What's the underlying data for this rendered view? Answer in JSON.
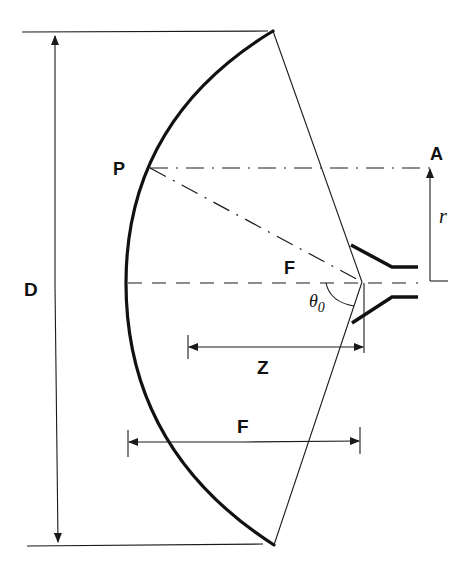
{
  "diagram": {
    "labels": {
      "diameter": "D",
      "point_p": "P",
      "point_a": "A",
      "radius": "r",
      "focus": "F",
      "half_angle": "θ",
      "half_angle_sub": "0",
      "axial_distance": "Z",
      "focal_length": "F"
    },
    "colors": {
      "line": "#1a1a1a",
      "background": "#ffffff"
    }
  }
}
